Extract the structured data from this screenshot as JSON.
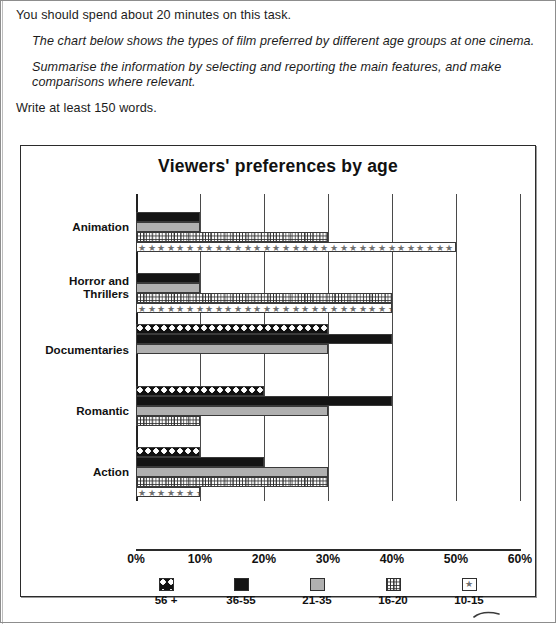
{
  "instructions": {
    "line1": "You should spend about 20 minutes on this task.",
    "line2": "The chart below shows the types of film preferred by different age groups at one cinema.",
    "line3": "Summarise the information by selecting and reporting the main features, and make comparisons where relevant.",
    "line4": "Write at least 150 words."
  },
  "chart_data": {
    "type": "bar",
    "orientation": "horizontal",
    "grouped": true,
    "title": "Viewers' preferences by age",
    "xlabel": "",
    "ylabel": "",
    "xlim": [
      0,
      60
    ],
    "xticks": [
      "0%",
      "10%",
      "20%",
      "30%",
      "40%",
      "50%",
      "60%"
    ],
    "xtick_values": [
      0,
      10,
      20,
      30,
      40,
      50,
      60
    ],
    "grid": true,
    "legend_position": "bottom",
    "categories": [
      "Animation",
      "Horror and Thrillers",
      "Documentaries",
      "Romantic",
      "Action"
    ],
    "series": [
      {
        "name": "56 +",
        "pattern": "dots",
        "values": [
          0,
          0,
          30,
          20,
          10
        ]
      },
      {
        "name": "36-55",
        "pattern": "black",
        "values": [
          10,
          10,
          40,
          40,
          20
        ]
      },
      {
        "name": "21-35",
        "pattern": "gray",
        "values": [
          10,
          10,
          30,
          30,
          30
        ]
      },
      {
        "name": "16-20",
        "pattern": "grid",
        "values": [
          30,
          40,
          0,
          10,
          30
        ]
      },
      {
        "name": "10-15",
        "pattern": "star",
        "values": [
          50,
          40,
          0,
          0,
          10
        ]
      }
    ]
  },
  "colors": {
    "black": "#141414",
    "gray": "#b0b0b0",
    "axis": "#2b2b2b",
    "star": "#6f6f6f",
    "page_border": "#8d8d8d"
  }
}
